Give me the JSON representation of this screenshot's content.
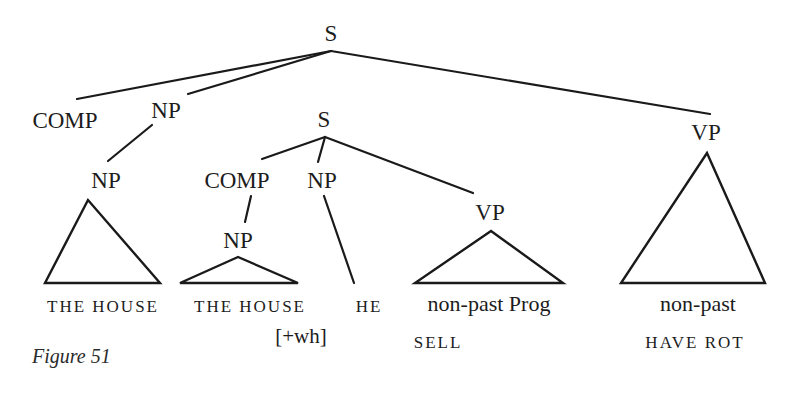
{
  "figure": {
    "caption": "Figure 51"
  },
  "tree": {
    "root": {
      "label": "S"
    },
    "comp_top": {
      "label": "COMP"
    },
    "np_top": {
      "label": "NP"
    },
    "np_head": {
      "label": "NP"
    },
    "s_embedded": {
      "label": "S"
    },
    "comp_embedded": {
      "label": "COMP"
    },
    "np_subject": {
      "label": "NP"
    },
    "np_wh": {
      "label": "NP"
    },
    "vp_embedded": {
      "label": "VP"
    },
    "vp_main": {
      "label": "VP"
    }
  },
  "leaves": {
    "head_noun": "THE HOUSE",
    "wh_noun": "THE HOUSE",
    "wh_feature": "[+wh]",
    "subject": "HE",
    "vp_embedded_tense": "non-past Prog",
    "vp_embedded_verb": "SELL",
    "vp_main_tense": "non-past",
    "vp_main_verb": "HAVE ROT"
  },
  "colors": {
    "ink": "#1a1a1a",
    "background": "#ffffff"
  }
}
